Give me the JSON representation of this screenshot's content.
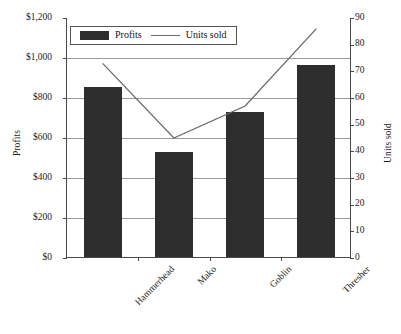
{
  "chart_data": {
    "type": "bar",
    "title": "",
    "categories": [
      "Hammerhead",
      "Mako",
      "Goblin",
      "Thresher"
    ],
    "series": [
      {
        "name": "Profits",
        "type": "bar",
        "axis": "left",
        "values": [
          850,
          525,
          725,
          960
        ],
        "color": "#2e2e2e"
      },
      {
        "name": "Units sold",
        "type": "line",
        "axis": "right",
        "values": [
          73,
          45,
          57,
          86
        ],
        "color": "#6a6a6a"
      }
    ],
    "xlabel": "",
    "ylabel": "Profits",
    "y2label": "Units sold",
    "ylim": [
      0,
      1200
    ],
    "y2lim": [
      0,
      90
    ],
    "yticks": [
      0,
      200,
      400,
      600,
      800,
      1000,
      1200
    ],
    "ytick_labels": [
      "$0",
      "$200",
      "$400",
      "$600",
      "$800",
      "$1,000",
      "$1,200"
    ],
    "y2ticks": [
      0,
      10,
      20,
      30,
      40,
      50,
      60,
      70,
      80,
      90
    ],
    "y2tick_labels": [
      "0",
      "10",
      "20",
      "30",
      "40",
      "50",
      "60",
      "70",
      "80",
      "90"
    ],
    "grid": true,
    "grid_axis": "y-left",
    "legend": [
      "Profits",
      "Units sold"
    ],
    "legend_position": "top-inside-left"
  },
  "legend": {
    "profits_label": "Profits",
    "units_label": "Units sold"
  },
  "axes": {
    "left_title": "Profits",
    "right_title": "Units sold"
  }
}
